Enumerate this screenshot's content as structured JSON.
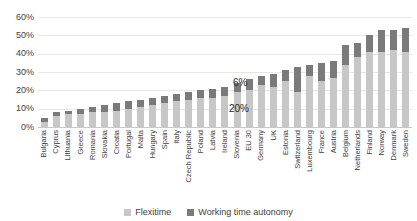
{
  "chart_data": {
    "type": "bar",
    "stacked": true,
    "title": "",
    "xlabel": "",
    "ylabel": "",
    "categories": [
      "Bulgaria",
      "Cyprus",
      "Lithuania",
      "Greece",
      "Romania",
      "Slovakia",
      "Croatia",
      "Portugal",
      "Malta",
      "Hungary",
      "Spain",
      "Italy",
      "Czech Republic",
      "Poland",
      "Latvia",
      "Ireland",
      "Slovenia",
      "EU 30",
      "Germany",
      "UK",
      "Estonia",
      "Switzerland",
      "Luxembourg",
      "France",
      "Austria",
      "Belgium",
      "Netherlands",
      "Finland",
      "Norway",
      "Denmark",
      "Sweden"
    ],
    "series": [
      {
        "name": "Flexitime",
        "color": "#c7c7c7",
        "values": [
          3,
          6,
          7,
          7,
          8,
          8,
          9,
          10,
          11,
          12,
          13,
          14,
          15,
          16,
          16,
          17,
          19,
          20,
          23,
          22,
          25,
          19,
          28,
          25,
          27,
          34,
          38,
          41,
          41,
          42,
          41
        ]
      },
      {
        "name": "Working time autonomy",
        "color": "#7a7a7a",
        "values": [
          2,
          2,
          2,
          3,
          3,
          4,
          4,
          4,
          4,
          4,
          4,
          4,
          4,
          4,
          5,
          5,
          5,
          6,
          5,
          7,
          6,
          14,
          6,
          10,
          9,
          11,
          8,
          9,
          12,
          11,
          13
        ]
      }
    ],
    "ylim": [
      0,
      60
    ],
    "y_ticks": [
      0,
      10,
      20,
      30,
      40,
      50,
      60
    ],
    "y_tick_suffix": "%",
    "grid": true,
    "legend_position": "bottom",
    "annotations": [
      {
        "text": "6%",
        "target": "EU 30",
        "series": "Working time autonomy",
        "x": 233,
        "y": 77
      },
      {
        "text": "20%",
        "target": "EU 30",
        "series": "Flexitime",
        "x": 229,
        "y": 103
      }
    ]
  }
}
